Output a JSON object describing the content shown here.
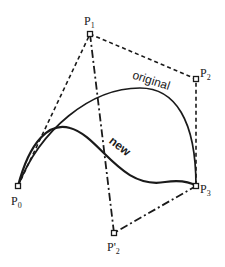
{
  "diagram": {
    "colors": {
      "ink": "#1a1a1a",
      "background": "#ffffff"
    },
    "control_points": [
      {
        "id": "P0",
        "label": "P",
        "sub": "0",
        "x": 18,
        "y": 186
      },
      {
        "id": "P1",
        "label": "P",
        "sub": "1",
        "x": 90,
        "y": 34
      },
      {
        "id": "P2",
        "label": "P",
        "sub": "2",
        "x": 196,
        "y": 79
      },
      {
        "id": "P3",
        "label": "P",
        "sub": "3",
        "x": 196,
        "y": 186
      },
      {
        "id": "P2prime",
        "label": "P'",
        "sub": "2",
        "x": 114,
        "y": 233
      }
    ],
    "curves": {
      "original": {
        "label": "original",
        "style": "solid"
      },
      "new": {
        "label": "new",
        "style": "solid"
      }
    },
    "polygons": {
      "original_control_polygon": {
        "style": "dashed",
        "points": [
          "P0",
          "P1",
          "P2",
          "P3"
        ]
      },
      "new_control_polygon": {
        "style": "dash-dot",
        "points": [
          "P1",
          "P2prime",
          "P3"
        ]
      }
    }
  }
}
